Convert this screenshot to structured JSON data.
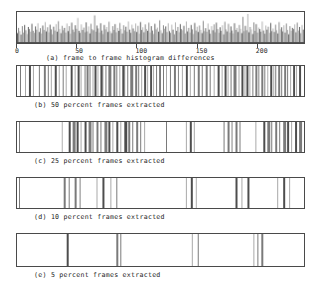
{
  "figure": {
    "panels": [
      {
        "id": "a",
        "caption": "(a) frame to frame  histogram differences",
        "type": "histogram"
      },
      {
        "id": "b",
        "caption": "(b) 50 percent frames extracted",
        "type": "bar-strip"
      },
      {
        "id": "c",
        "caption": "(c) 25 percent frames extracted",
        "type": "bar-strip"
      },
      {
        "id": "d",
        "caption": "(d) 10 percent frames extracted",
        "type": "bar-strip"
      },
      {
        "id": "e",
        "caption": "(e)  5 percent frames extracted",
        "type": "bar-strip"
      }
    ]
  },
  "colors": {
    "frame": "#4a4a4a",
    "bar_dark": "#4d4d4d",
    "bar_mid": "#7a7a7a",
    "bar_light": "#a8a8a8",
    "background": "#ffffff",
    "text": "#232323"
  },
  "chart_data": [
    {
      "type": "bar",
      "id": "panel-a",
      "title": "(a) frame to frame  histogram differences",
      "xlabel": "",
      "ylabel": "",
      "grid": false,
      "legend": null,
      "xlim": [
        0,
        240
      ],
      "ylim": [
        0,
        1
      ],
      "xticks": [
        0,
        50,
        100,
        150,
        200
      ],
      "xtick_labels": [
        "0",
        "50",
        "100",
        "150",
        "200"
      ],
      "x": [
        1,
        2,
        3,
        4,
        5,
        6,
        7,
        8,
        9,
        10,
        11,
        12,
        13,
        14,
        15,
        16,
        17,
        18,
        19,
        20,
        21,
        22,
        23,
        24,
        25,
        26,
        27,
        28,
        29,
        30,
        31,
        32,
        33,
        34,
        35,
        36,
        37,
        38,
        39,
        40,
        41,
        42,
        43,
        44,
        45,
        46,
        47,
        48,
        49,
        50,
        51,
        52,
        53,
        54,
        55,
        56,
        57,
        58,
        59,
        60,
        61,
        62,
        63,
        64,
        65,
        66,
        67,
        68,
        69,
        70,
        71,
        72,
        73,
        74,
        75,
        76,
        77,
        78,
        79,
        80,
        81,
        82,
        83,
        84,
        85,
        86,
        87,
        88,
        89,
        90,
        91,
        92,
        93,
        94,
        95,
        96,
        97,
        98,
        99,
        100,
        101,
        102,
        103,
        104,
        105,
        106,
        107,
        108,
        109,
        110,
        111,
        112,
        113,
        114,
        115,
        116,
        117,
        118,
        119,
        120,
        121,
        122,
        123,
        124,
        125,
        126,
        127,
        128,
        129,
        130,
        131,
        132,
        133,
        134,
        135,
        136,
        137,
        138,
        139,
        140,
        141,
        142,
        143,
        144,
        145,
        146,
        147,
        148,
        149,
        150,
        151,
        152,
        153,
        154,
        155,
        156,
        157,
        158,
        159,
        160,
        161,
        162,
        163,
        164,
        165,
        166,
        167,
        168,
        169,
        170,
        171,
        172,
        173,
        174,
        175,
        176,
        177,
        178,
        179,
        180,
        181,
        182,
        183,
        184,
        185,
        186,
        187,
        188,
        189,
        190,
        191,
        192,
        193,
        194,
        195,
        196,
        197,
        198,
        199,
        200,
        201,
        202,
        203,
        204,
        205,
        206,
        207,
        208,
        209,
        210,
        211,
        212,
        213,
        214,
        215,
        216,
        217,
        218,
        219,
        220,
        221,
        222,
        223,
        224,
        225,
        226,
        227,
        228,
        229,
        230,
        231,
        232,
        233,
        234,
        235,
        236,
        237,
        238,
        239,
        240
      ],
      "values": [
        0.34,
        0.52,
        0.41,
        0.29,
        0.58,
        0.36,
        0.62,
        0.44,
        0.31,
        0.55,
        0.48,
        0.39,
        0.66,
        0.42,
        0.35,
        0.57,
        0.46,
        0.68,
        0.38,
        0.51,
        0.33,
        0.6,
        0.45,
        0.72,
        0.4,
        0.54,
        0.37,
        0.63,
        0.47,
        0.3,
        0.56,
        0.43,
        0.65,
        0.39,
        0.75,
        0.48,
        0.34,
        0.59,
        0.44,
        0.52,
        0.36,
        0.67,
        0.41,
        0.58,
        0.32,
        0.7,
        0.46,
        0.38,
        0.61,
        0.49,
        0.86,
        0.42,
        0.35,
        0.64,
        0.45,
        0.53,
        0.37,
        0.71,
        0.4,
        0.57,
        0.33,
        0.66,
        0.48,
        0.44,
        0.95,
        0.39,
        0.6,
        0.5,
        0.36,
        0.68,
        0.43,
        0.31,
        0.62,
        0.47,
        0.55,
        0.38,
        0.73,
        0.41,
        0.34,
        0.58,
        0.45,
        0.65,
        0.37,
        0.52,
        0.42,
        0.69,
        0.48,
        0.33,
        0.61,
        0.44,
        0.56,
        0.39,
        0.74,
        0.46,
        0.35,
        0.63,
        0.5,
        0.41,
        0.67,
        0.38,
        0.59,
        0.32,
        0.72,
        0.45,
        0.54,
        0.37,
        0.64,
        0.48,
        0.42,
        0.7,
        0.36,
        0.58,
        0.43,
        0.31,
        0.66,
        0.47,
        0.53,
        0.39,
        0.78,
        0.44,
        0.34,
        0.61,
        0.49,
        0.57,
        0.38,
        0.68,
        0.41,
        0.35,
        0.63,
        0.46,
        0.3,
        0.71,
        0.42,
        0.55,
        0.37,
        0.65,
        0.48,
        0.44,
        0.59,
        0.33,
        0.74,
        0.4,
        0.52,
        0.36,
        0.62,
        0.47,
        0.31,
        0.69,
        0.43,
        0.56,
        0.38,
        0.6,
        0.45,
        0.34,
        0.76,
        0.41,
        0.51,
        0.39,
        0.67,
        0.46,
        0.32,
        0.58,
        0.44,
        0.64,
        0.37,
        0.7,
        0.48,
        0.35,
        0.54,
        0.42,
        0.61,
        0.3,
        0.73,
        0.47,
        0.4,
        0.66,
        0.36,
        0.57,
        0.43,
        0.33,
        0.68,
        0.45,
        0.52,
        0.38,
        0.62,
        0.49,
        0.34,
        0.9,
        0.41,
        0.59,
        0.44,
        1.0,
        0.37,
        0.55,
        0.47,
        0.31,
        0.71,
        0.42,
        0.65,
        0.36,
        0.53,
        0.48,
        0.39,
        0.74,
        0.43,
        0.32,
        0.6,
        0.46,
        0.56,
        0.35,
        0.69,
        0.41,
        0.5,
        0.38,
        0.63,
        0.44,
        0.33,
        0.72,
        0.47,
        0.54,
        0.4,
        0.61,
        0.36,
        0.67,
        0.45,
        0.3,
        0.58,
        0.42,
        0.52,
        0.48,
        0.64,
        0.37,
        0.7,
        0.43,
        0.55,
        0.34,
        0.62,
        0.46
      ]
    },
    {
      "type": "bar",
      "id": "panel-b",
      "title": "(b) 50 percent frames extracted",
      "description": "selected frame indices rendered as vertical lines across the strip",
      "xlim": [
        0,
        289
      ],
      "grid": false,
      "line_positions": [
        3,
        8,
        12,
        16,
        22,
        27,
        31,
        34,
        38,
        42,
        46,
        49,
        54,
        58,
        61,
        64,
        68,
        70,
        73,
        76,
        78,
        81,
        84,
        86,
        89,
        92,
        94,
        97,
        100,
        103,
        106,
        108,
        111,
        114,
        116,
        119,
        122,
        125,
        128,
        131,
        134,
        137,
        140,
        143,
        147,
        150,
        154,
        158,
        162,
        166,
        170,
        174,
        178,
        182,
        186,
        190,
        194,
        198,
        202,
        206,
        209,
        212,
        215,
        218,
        220,
        223,
        226,
        229,
        231,
        234,
        237,
        240,
        243,
        246,
        249,
        252,
        255,
        258,
        260,
        263,
        266,
        269,
        272,
        275,
        278,
        281,
        284
      ],
      "line_widths": [
        1,
        1,
        2,
        1,
        1,
        2,
        1,
        1,
        2,
        1,
        1,
        1,
        2,
        1,
        2,
        1,
        1,
        2,
        1,
        1,
        2,
        1,
        2,
        1,
        1,
        2,
        1,
        2,
        1,
        1,
        2,
        1,
        1,
        2,
        1,
        2,
        1,
        1,
        2,
        1,
        2,
        1,
        1,
        2,
        1,
        1,
        1,
        2,
        1,
        1,
        2,
        1,
        1,
        2,
        1,
        2,
        1,
        1,
        2,
        1,
        2,
        1,
        1,
        2,
        1,
        1,
        2,
        1,
        2,
        1,
        1,
        2,
        1,
        2,
        1,
        1,
        2,
        1,
        1,
        2,
        1,
        2,
        1,
        1,
        2,
        1,
        2
      ]
    },
    {
      "type": "bar",
      "id": "panel-c",
      "title": "(c) 25 percent frames extracted",
      "description": "selected frame indices rendered as vertical lines across the strip",
      "xlim": [
        0,
        289
      ],
      "grid": false,
      "line_positions": [
        2,
        45,
        52,
        56,
        60,
        64,
        68,
        72,
        76,
        80,
        84,
        88,
        92,
        96,
        100,
        104,
        108,
        112,
        116,
        120,
        124,
        128,
        150,
        170,
        174,
        178,
        208,
        212,
        216,
        220,
        224,
        240,
        248,
        252,
        256,
        260,
        264,
        268,
        272,
        276,
        280,
        284
      ],
      "line_widths": [
        1,
        1,
        2,
        3,
        2,
        1,
        2,
        3,
        1,
        2,
        1,
        3,
        2,
        1,
        2,
        1,
        3,
        2,
        1,
        2,
        1,
        1,
        1,
        1,
        2,
        1,
        1,
        2,
        1,
        2,
        1,
        1,
        2,
        3,
        1,
        2,
        1,
        3,
        2,
        1,
        2,
        3
      ]
    },
    {
      "type": "bar",
      "id": "panel-d",
      "title": "(d) 10 percent frames extracted",
      "description": "selected frame indices rendered as vertical lines across the strip",
      "xlim": [
        0,
        289
      ],
      "grid": false,
      "line_positions": [
        2,
        47,
        52,
        58,
        63,
        80,
        86,
        94,
        100,
        170,
        175,
        180,
        220,
        226,
        232,
        262,
        268,
        274
      ],
      "line_widths": [
        1,
        2,
        1,
        2,
        1,
        1,
        2,
        1,
        1,
        1,
        2,
        1,
        2,
        1,
        2,
        1,
        2,
        1
      ]
    },
    {
      "type": "bar",
      "id": "panel-e",
      "title": "(e)  5 percent frames extracted",
      "description": "selected frame indices rendered as vertical lines across the strip",
      "xlim": [
        0,
        289
      ],
      "grid": false,
      "line_positions": [
        50,
        100,
        104,
        176,
        182,
        238,
        242,
        246
      ],
      "line_widths": [
        2,
        2,
        1,
        1,
        1,
        1,
        1,
        2
      ]
    }
  ]
}
